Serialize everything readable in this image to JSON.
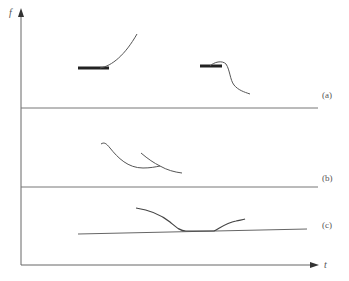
{
  "diagram": {
    "axes": {
      "y_label": "f",
      "x_label": "t"
    },
    "panels": [
      {
        "id": "a",
        "label": "(a)",
        "description": "Flat segment rising into a curve; second flat segment with bump then falling curve"
      },
      {
        "id": "b",
        "label": "(b)",
        "description": "Two overlapping descending curves"
      },
      {
        "id": "c",
        "label": "(c)",
        "description": "Curve dipping to meet a slanted baseline then rising"
      }
    ],
    "colors": {
      "line": "#555555",
      "thick_segment": "#222222",
      "background": "#ffffff"
    }
  }
}
